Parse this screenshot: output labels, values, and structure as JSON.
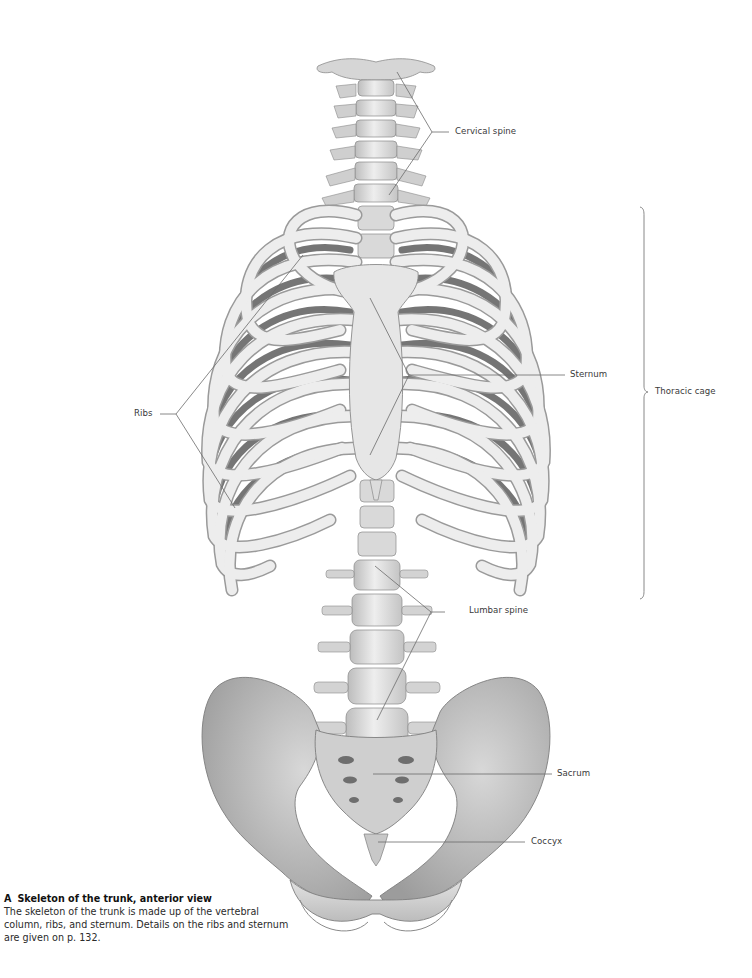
{
  "figure": {
    "letter": "A",
    "title": "Skeleton of the trunk, anterior view",
    "caption": "The skeleton of the trunk is made up of the vertebral column, ribs, and sternum. Details on the ribs and sternum are given on p. 132.",
    "view": "anterior"
  },
  "labels": {
    "cervical_spine": "Cervical spine",
    "thoracic_cage": "Thoracic cage",
    "sternum": "Sternum",
    "ribs": "Ribs",
    "lumbar_spine": "Lumbar spine",
    "sacrum": "Sacrum",
    "coccyx": "Coccyx"
  },
  "colors": {
    "bone_light": "#ececec",
    "bone_mid": "#cfcfcf",
    "bone_dark": "#8a8a8a",
    "rib_shadow": "#5e5e5e",
    "leader_line": "#6b6b6b",
    "text": "#3a3a3a"
  }
}
